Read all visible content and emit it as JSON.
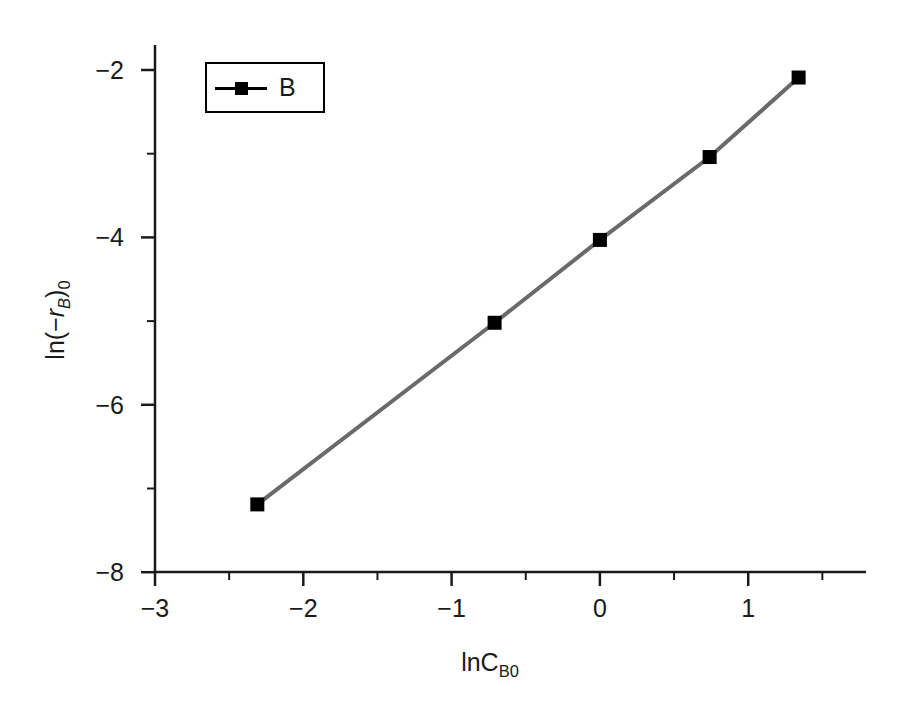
{
  "chart_data": {
    "type": "line",
    "title": "",
    "xlabel": "lnC_B0",
    "ylabel": "ln(-r_B)_0",
    "xlim": [
      -3.0,
      1.5
    ],
    "ylim": [
      -8.0,
      -1.5
    ],
    "grid": false,
    "legend_position": "upper left",
    "series": [
      {
        "name": "B",
        "marker": "square",
        "marker_color": "#000000",
        "line_color": "#6a6a6a",
        "x": [
          -2.31,
          -0.71,
          0.0,
          0.74,
          1.34
        ],
        "y": [
          -7.19,
          -5.02,
          -4.03,
          -3.04,
          -2.09
        ]
      }
    ],
    "x_ticks_major": [
      -3,
      -2,
      -1,
      0,
      1
    ],
    "x_tick_labels": [
      "-3",
      "-2",
      "-1",
      "0",
      "1"
    ],
    "x_ticks_minor": [
      -2.5,
      -1.5,
      -0.5,
      0.5,
      1.5
    ],
    "y_ticks_major": [
      -2,
      -4,
      -6,
      -8
    ],
    "y_tick_labels": [
      "-2",
      "-4",
      "-6",
      "-8"
    ],
    "y_ticks_minor": [
      -3,
      -5,
      -7
    ]
  },
  "axes": {
    "x_label_text": "lnC",
    "x_label_sub": "B0",
    "y_label_prefix": "ln(−",
    "y_label_var": "r",
    "y_label_var_sub": "B",
    "y_label_suffix": ")",
    "y_label_outer_sub": "0"
  },
  "legend": {
    "entries": [
      {
        "label": "B"
      }
    ]
  }
}
